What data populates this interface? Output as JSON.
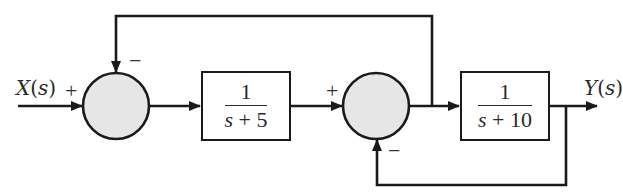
{
  "diagram": {
    "type": "block-diagram",
    "colors": {
      "line": "#1a1a1a",
      "summer_fill": "#e6e6e6",
      "block_fill": "#ffffff",
      "text": "#2a2a2a"
    },
    "input": {
      "label_var": "X",
      "label_arg": "s"
    },
    "output": {
      "label_var": "Y",
      "label_arg": "s"
    },
    "summer1": {
      "input_sign": "+",
      "feedback_sign": "−"
    },
    "block1": {
      "numerator": "1",
      "denominator_var": "s",
      "denominator_rest": " + 5"
    },
    "summer2": {
      "input_sign": "+",
      "feedback_sign": "−"
    },
    "block2": {
      "numerator": "1",
      "denominator_var": "s",
      "denominator_rest": " + 10"
    },
    "edges": [
      {
        "from": "X(s)",
        "to": "summer1",
        "sign": "+"
      },
      {
        "from": "summer1",
        "to": "block1"
      },
      {
        "from": "block1",
        "to": "summer2",
        "sign": "+"
      },
      {
        "from": "summer2",
        "to": "block2"
      },
      {
        "from": "summer2-output-branch",
        "to": "summer1",
        "sign": "−",
        "route": "top"
      },
      {
        "from": "block2",
        "to": "Y(s)"
      },
      {
        "from": "Y(s)-branch",
        "to": "summer2",
        "sign": "−",
        "route": "bottom"
      }
    ]
  }
}
